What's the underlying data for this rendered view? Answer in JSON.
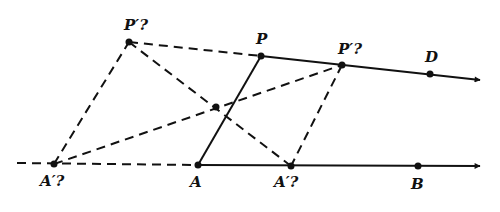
{
  "figure": {
    "type": "geometry-construction",
    "lines": {
      "line_AB": {
        "label": "line AB",
        "style": "solid",
        "arrow": true
      },
      "line_PD": {
        "label": "line PD",
        "style": "solid",
        "arrow": true
      },
      "segment_AP": {
        "label": "segment AP",
        "style": "solid"
      }
    },
    "points": [
      {
        "id": "P_prime_left",
        "label": "P′?",
        "x": 129,
        "y": 42
      },
      {
        "id": "P",
        "label": "P",
        "x": 261,
        "y": 56
      },
      {
        "id": "P_prime_right",
        "label": "P′?",
        "x": 342,
        "y": 65
      },
      {
        "id": "D",
        "label": "D",
        "x": 430,
        "y": 74
      },
      {
        "id": "A_prime_left",
        "label": "A′?",
        "x": 54,
        "y": 164
      },
      {
        "id": "A",
        "label": "A",
        "x": 198,
        "y": 165
      },
      {
        "id": "A_prime_right",
        "label": "A′?",
        "x": 291,
        "y": 166
      },
      {
        "id": "B",
        "label": "B",
        "x": 418,
        "y": 166
      },
      {
        "id": "center",
        "label": "",
        "x": 216,
        "y": 107
      }
    ],
    "labels": {
      "P_prime_left": "P′?",
      "P": "P",
      "P_prime_right": "P′?",
      "D": "D",
      "A_prime_left": "A′?",
      "A": "A",
      "A_prime_right": "A′?",
      "B": "B"
    },
    "colors": {
      "ink": "#111111",
      "background": "#ffffff"
    }
  }
}
